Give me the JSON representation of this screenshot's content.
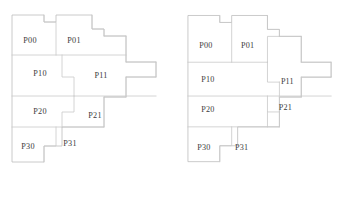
{
  "figure": {
    "title": "",
    "background_color": "#ffffff",
    "line_color": "#c9c9c9",
    "label_color": "#3a3a3a",
    "panel_count": 2
  },
  "panels": [
    {
      "id": "left",
      "name": "left-partitioning-diagram",
      "outline": "M 12,15 L 44,15 L 44,22 L 56,22 L 56,15 L 92,15 L 92,29 L 104,29 L 104,36 L 126,36 L 126,62 L 156,62 L 156,77 L 126,77 L 126,97 L 104,97 L 104,127 L 62,127 L 62,146 L 44,146 L 44,162 L 12,162 L 12,15 Z",
      "internal_edges": [
        "M 12,55 L 126,55",
        "M 12,96 L 156,96",
        "M 12,127 L 104,127",
        "M 44,15 L 44,22 L 56,22 L 56,55",
        "M 62,55 L 62,77 L 74,77 L 74,96",
        "M 74,96 L 74,112 L 62,112 L 62,127",
        "M 56,127 L 56,146 L 44,146 L 44,162",
        "M 92,15 L 92,29 L 104,29 L 104,36",
        "M 104,36 L 126,36",
        "M 126,36 L 126,62",
        "M 126,62 L 156,62",
        "M 156,62 L 156,77",
        "M 156,77 L 126,77",
        "M 126,77 L 126,97",
        "M 126,97 L 104,97",
        "M 104,97 L 104,127"
      ],
      "labels": [
        {
          "text": "P00",
          "x": 30,
          "y": 43
        },
        {
          "text": "P01",
          "x": 74,
          "y": 43
        },
        {
          "text": "P10",
          "x": 40,
          "y": 76
        },
        {
          "text": "P11",
          "x": 101,
          "y": 78
        },
        {
          "text": "P20",
          "x": 40,
          "y": 114
        },
        {
          "text": "P21",
          "x": 95,
          "y": 118
        },
        {
          "text": "P30",
          "x": 28,
          "y": 149
        },
        {
          "text": "P31",
          "x": 70,
          "y": 146
        }
      ]
    },
    {
      "id": "right",
      "name": "right-partitioning-diagram",
      "outline": "M 12,15 L 44,15 L 44,22 L 56,22 L 56,15 L 92,15 L 92,29 L 104,29 L 104,36 L 126,36 L 126,62 L 156,62 L 156,77 L 126,77 L 126,97 L 104,97 L 104,127 L 62,127 L 62,146 L 44,146 L 44,162 L 12,162 L 12,15 Z",
      "internal_edges": [
        "M 12,62 L 92,62",
        "M 12,96 L 156,96",
        "M 12,127 L 104,127",
        "M 44,15 L 44,22 L 56,22 L 56,62",
        "M 56,127 L 56,146 L 44,146 L 44,162",
        "M 92,15 L 92,29 L 104,29 L 104,36",
        "M 104,36 L 126,36",
        "M 126,36 L 126,62",
        "M 126,62 L 156,62",
        "M 156,62 L 156,77",
        "M 156,77 L 126,77",
        "M 126,77 L 126,97",
        "M 126,97 L 104,97",
        "M 104,97 L 104,127",
        "M 92,62 L 92,36 L 104,36",
        "M 92,62 L 92,82 L 104,82",
        "M 104,82 L 104,96",
        "M 92,96 L 92,112 L 104,112",
        "M 92,112 L 92,127"
      ],
      "labels": [
        {
          "text": "P00",
          "x": 30,
          "y": 48
        },
        {
          "text": "P01",
          "x": 72,
          "y": 48
        },
        {
          "text": "P10",
          "x": 32,
          "y": 82
        },
        {
          "text": "P11",
          "x": 112,
          "y": 84
        },
        {
          "text": "P20",
          "x": 32,
          "y": 112
        },
        {
          "text": "P21",
          "x": 110,
          "y": 110
        },
        {
          "text": "P30",
          "x": 28,
          "y": 150
        },
        {
          "text": "P31",
          "x": 66,
          "y": 150
        }
      ]
    }
  ]
}
